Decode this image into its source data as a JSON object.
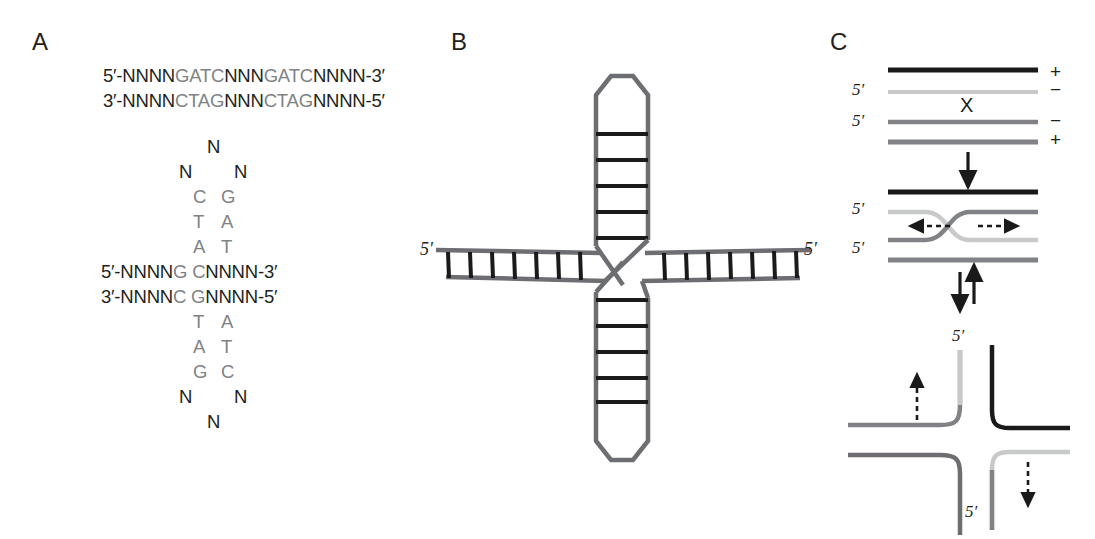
{
  "figure": {
    "background": "#ffffff",
    "width": 1095,
    "height": 539
  },
  "colors": {
    "black": "#231f20",
    "dark_gray": "#58595b",
    "mid_gray": "#808285",
    "light_gray": "#bcbec0",
    "rung_black": "#1a1a1a",
    "backbone_gray": "#6d6e71"
  },
  "panels": {
    "a": {
      "letter": "A",
      "duplex": {
        "top": {
          "prefix": "5′-NNNN",
          "site1": "GATC",
          "middle": "NNN",
          "site2": "GATC",
          "suffix": "NNNN-3′"
        },
        "bottom": {
          "prefix": "3′-NNNN",
          "site1": "CTAG",
          "middle": "NNN",
          "site2": "CTAG",
          "suffix": "NNNN-5′"
        }
      },
      "cruciform": {
        "top_loop_apex": "N",
        "top_loop_left": "N",
        "top_loop_right": "N",
        "top_stem": [
          {
            "left": "C",
            "right": "G"
          },
          {
            "left": "T",
            "right": "A"
          },
          {
            "left": "A",
            "right": "T"
          }
        ],
        "core_top": {
          "prefix": "5′-NNNN",
          "left_base": "G",
          "right_base": "C",
          "suffix": "NNNN-3′"
        },
        "core_bottom": {
          "prefix": "3′-NNNN",
          "left_base": "C",
          "right_base": "G",
          "suffix": "NNNN-5′"
        },
        "bottom_stem": [
          {
            "left": "T",
            "right": "A"
          },
          {
            "left": "A",
            "right": "T"
          },
          {
            "left": "G",
            "right": "C"
          }
        ],
        "bottom_loop_left": "N",
        "bottom_loop_right": "N",
        "bottom_loop_apex": "N"
      }
    },
    "b": {
      "letter": "B",
      "left_arm_label": "5′",
      "right_arm_label": "5′",
      "left_arm_rungs": 7,
      "right_arm_rungs": 8,
      "top_hairpin_rungs": 5,
      "bottom_hairpin_rungs": 5,
      "loop_shape": "hexagon"
    },
    "c": {
      "letter": "C",
      "stage_top": {
        "strand_labels": [
          "+",
          "−",
          "−",
          "+"
        ],
        "five_prime_labels": [
          "5′",
          "5′"
        ],
        "crossover_mark": "X",
        "arrow": "down-arrow"
      },
      "stage_middle": {
        "five_prime_labels": [
          "5′",
          "5′"
        ],
        "branch_arrows": [
          "left-dashed-arrow",
          "right-dashed-arrow"
        ],
        "equilibrium_arrows": "up-down-arrows"
      },
      "stage_bottom": {
        "five_prime_top": "5′",
        "five_prime_bottom": "5′",
        "dashed_arrows": [
          "up-dashed-arrow",
          "down-dashed-arrow"
        ]
      }
    }
  }
}
